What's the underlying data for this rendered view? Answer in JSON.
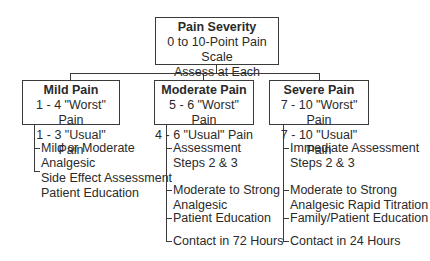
{
  "root": {
    "title": "Pain Severity",
    "line1": "0 to 10-Point Pain Scale",
    "line2": "Assess at Each Contact"
  },
  "categories": [
    {
      "title": "Mild Pain",
      "line1": "1 - 4 \"Worst\" Pain",
      "line2": "1 - 3 \"Usual\" Pain",
      "items": [
        [
          "Mild or Moderate",
          "Analgesic"
        ],
        [
          "Side Effect Assessment",
          "Patient Education"
        ]
      ]
    },
    {
      "title": "Moderate Pain",
      "line1": "5 - 6 \"Worst\" Pain",
      "line2": "4 - 6 \"Usual\" Pain",
      "items": [
        [
          "Assessment",
          "Steps 2 & 3"
        ],
        [
          "Moderate to Strong",
          "Analgesic"
        ],
        [
          "Patient Education"
        ],
        [
          "Contact in 72 Hours"
        ]
      ]
    },
    {
      "title": "Severe Pain",
      "line1": "7 - 10 \"Worst\" Pain",
      "line2": "7 - 10 \"Usual\" Pain",
      "items": [
        [
          "Immediate Assessment",
          "Steps 2 & 3"
        ],
        [
          "Moderate to Strong",
          "Analgesic Rapid Titration"
        ],
        [
          "Family/Patient Education"
        ],
        [
          "Contact in 24 Hours"
        ]
      ]
    }
  ]
}
